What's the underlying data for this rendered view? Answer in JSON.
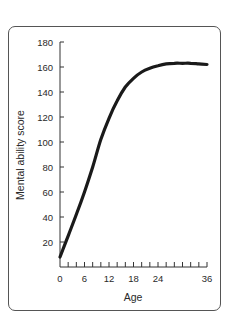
{
  "chart_data": {
    "type": "line",
    "title": "",
    "xlabel": "Age",
    "ylabel": "Mental ability score",
    "xlim": [
      0,
      36
    ],
    "ylim": [
      0,
      180
    ],
    "x_ticks": [
      0,
      6,
      12,
      18,
      24,
      36
    ],
    "y_ticks": [
      20,
      40,
      60,
      80,
      100,
      120,
      140,
      160,
      180
    ],
    "minor_x_tick_step": 2,
    "grid": false,
    "legend": null,
    "series": [
      {
        "name": "Mental ability score",
        "color": "#1a1a1a",
        "x": [
          0,
          2,
          4,
          6,
          8,
          10,
          12,
          14,
          16,
          18,
          20,
          22,
          24,
          26,
          28,
          30,
          32,
          34,
          36
        ],
        "values": [
          8,
          25,
          42,
          60,
          80,
          102,
          119,
          133,
          144,
          151,
          156,
          159,
          161,
          162.5,
          163,
          163,
          163,
          162.5,
          162
        ]
      }
    ]
  }
}
